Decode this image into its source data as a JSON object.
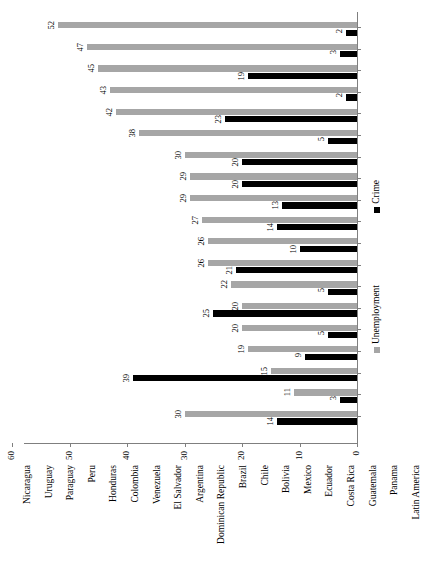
{
  "chart_data": {
    "type": "bar",
    "orientation": "vertical-rotated",
    "title": "",
    "subtitle": "",
    "xlabel": "",
    "ylabel": "",
    "ylim": [
      0,
      60
    ],
    "ytick_labels": [
      "0",
      "10",
      "20",
      "30",
      "40",
      "50",
      "60"
    ],
    "ytick_values": [
      0,
      10,
      20,
      30,
      40,
      50,
      60
    ],
    "grid": false,
    "legend_position": "right",
    "categories": [
      "Nicaragua",
      "Uruguay",
      "Paraguay",
      "Peru",
      "Honduras",
      "Colombia",
      "Venezuela",
      "El Salvador",
      "Argentina",
      "Dominican Republic",
      "Brazil",
      "Chile",
      "Bolivia",
      "Mexico",
      "Ecuador",
      "Costa Rica",
      "Guatemala",
      "Panama",
      "Latin America"
    ],
    "series": [
      {
        "name": "Crime",
        "color": "#000000",
        "values": [
          2,
          3,
          19,
          2,
          23,
          5,
          20,
          20,
          13,
          14,
          10,
          21,
          5,
          25,
          5,
          9,
          39,
          3,
          14
        ]
      },
      {
        "name": "Unemployment",
        "color": "#a6a6a6",
        "values": [
          52,
          47,
          45,
          43,
          42,
          38,
          30,
          29,
          29,
          27,
          26,
          26,
          22,
          20,
          20,
          19,
          15,
          11,
          30
        ]
      }
    ],
    "legend": [
      {
        "label": "Crime",
        "color": "#000000"
      },
      {
        "label": "Unemployment",
        "color": "#a6a6a6"
      }
    ]
  }
}
